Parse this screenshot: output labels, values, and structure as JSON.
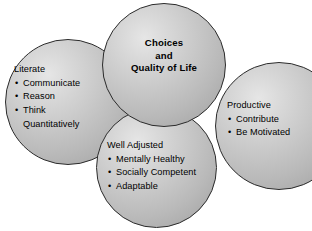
{
  "diagram": {
    "background_color": "#ffffff",
    "sphere_fill_light": "#e6e6e6",
    "sphere_fill_dark": "#a2a2a2",
    "outline_color": "#2b2b2b",
    "text_color": "#000000",
    "bullet_glyph": "•",
    "center": {
      "name": "choices-and-quality-of-life",
      "lines": [
        "Choices",
        "and",
        "Quality of Life"
      ]
    },
    "groups": [
      {
        "name": "literate",
        "title": "Literate",
        "items": [
          {
            "text": "Communicate",
            "continuation": ""
          },
          {
            "text": "Reason",
            "continuation": ""
          },
          {
            "text": "Think",
            "continuation": "Quantitatively"
          }
        ]
      },
      {
        "name": "productive",
        "title": "Productive",
        "items": [
          {
            "text": "Contribute",
            "continuation": ""
          },
          {
            "text": "Be Motivated",
            "continuation": ""
          }
        ]
      },
      {
        "name": "well-adjusted",
        "title": "Well Adjusted",
        "items": [
          {
            "text": "Mentally Healthy",
            "continuation": ""
          },
          {
            "text": "Socially Competent",
            "continuation": ""
          },
          {
            "text": "Adaptable",
            "continuation": ""
          }
        ]
      }
    ]
  }
}
